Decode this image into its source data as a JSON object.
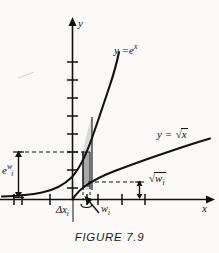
{
  "figure": {
    "caption": "FIGURE 7.9",
    "axes": {
      "x_label": "x",
      "y_label": "y",
      "x_axis_y": 199,
      "y_axis_x": 72,
      "x_ticks": [
        14,
        22,
        50,
        87,
        98,
        122,
        145,
        170
      ],
      "y_ticks": [
        62,
        80,
        98,
        116,
        134,
        152,
        170,
        188
      ]
    },
    "curves": [
      {
        "name": "exponential",
        "label": "y = e^x",
        "label_plain": "y =",
        "base": "e",
        "exponent": "x",
        "color": "#111111"
      },
      {
        "name": "square-root",
        "label": "y = sqrt(x)",
        "label_plain": "y =",
        "radicand": "x",
        "color": "#111111"
      }
    ],
    "annotations": {
      "exp_height_label_base": "e",
      "exp_height_label_exponent": "w",
      "exp_height_label_exponent_sub": "i",
      "sqrt_height_radicand": "w",
      "sqrt_height_radicand_sub": "i",
      "delta_x_symbol": "Δx",
      "delta_x_sub": "i",
      "w_symbol": "w",
      "w_sub": "i"
    },
    "shading": {
      "light_fill": "#d8d8d8",
      "dark_fill": "#a9a9a9",
      "stroke": "#111111"
    },
    "dashed_lines": [
      {
        "name": "upper-dashed",
        "y": 152,
        "x_from": 18,
        "x_to": 83
      },
      {
        "name": "lower-dashed",
        "y": 182,
        "x_from": 88,
        "x_to": 141
      }
    ]
  }
}
